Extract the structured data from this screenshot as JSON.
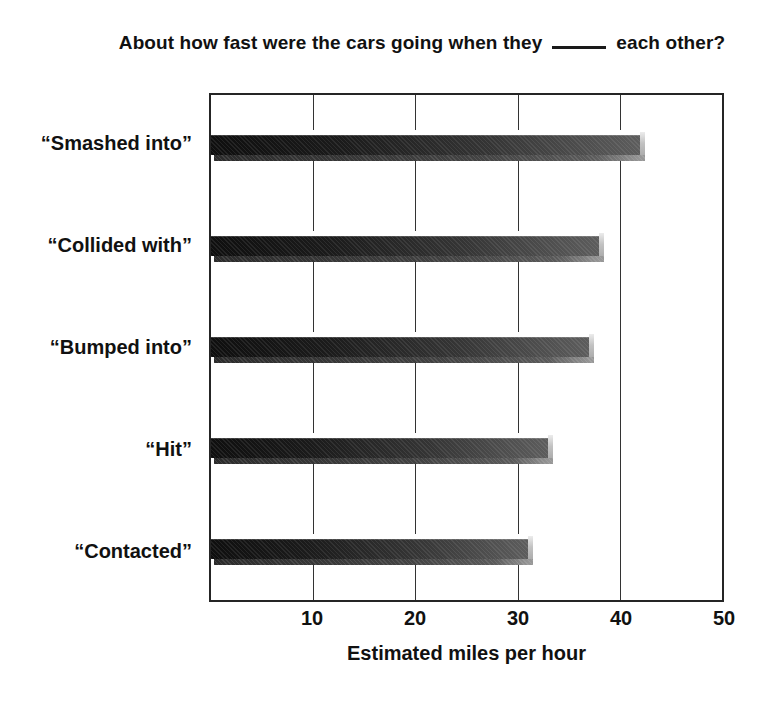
{
  "page": {
    "background": "#ffffff",
    "text_color": "#111111"
  },
  "title": {
    "prefix": "About how fast were the cars going when they",
    "suffix": "each other?"
  },
  "chart_data": {
    "type": "bar",
    "orientation": "horizontal",
    "categories": [
      "“Smashed into”",
      "“Collided with”",
      "“Bumped into”",
      "“Hit”",
      "“Contacted”"
    ],
    "values": [
      42,
      38,
      37,
      33,
      31
    ],
    "xlabel": "Estimated miles per hour",
    "xlim": [
      0,
      50
    ],
    "xticks": [
      10,
      20,
      30,
      40,
      50
    ],
    "grid": true,
    "legend": "none",
    "bar_style": {
      "face_dark": "#0f0f0f",
      "face_light": "#5d5d5d",
      "end_cap": "#c2c2c2",
      "bottom_shadow": "#424242",
      "top_highlight": "#ffffff"
    },
    "frame_color": "#252525",
    "gridline_color": "#333333"
  }
}
